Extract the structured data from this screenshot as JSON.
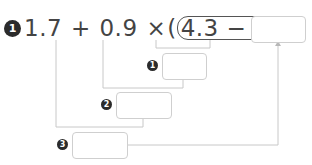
{
  "problem": {
    "number": "1",
    "terms": {
      "a": "1.7",
      "op1": "+",
      "b": "0.9",
      "op2": "×",
      "paren_open": "(",
      "inner": "4.3 − 2.6",
      "paren_close": ")",
      "eq": "="
    },
    "answer_value": ""
  },
  "steps": [
    {
      "number": "1",
      "value": ""
    },
    {
      "number": "2",
      "value": ""
    },
    {
      "number": "3",
      "value": ""
    }
  ],
  "colors": {
    "text": "#444444",
    "badge": "#2b2b2b",
    "box_border": "#cfcfcf",
    "line": "#c8c8c8"
  }
}
